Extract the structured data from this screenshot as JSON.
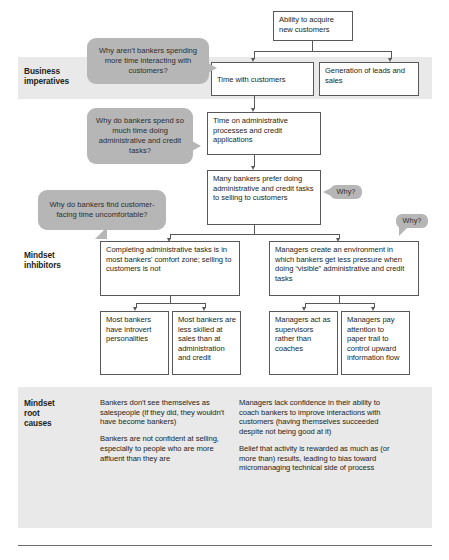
{
  "diagram": {
    "colors": {
      "band": "#e9e9e9",
      "bubble": "#b6b6b6",
      "box_border": "#58585a",
      "text": "#231f20"
    },
    "rows": [
      {
        "id": "business-imperatives",
        "label": "Business\nimperatives"
      },
      {
        "id": "mindset-inhibitors",
        "label": "Mindset\ninhibitors"
      },
      {
        "id": "mindset-root-causes",
        "label": "Mindset\nroot\ncauses"
      }
    ],
    "row_labels": {
      "business_imperatives": "Business imperatives",
      "business_imperatives_l1": "Business",
      "business_imperatives_l2": "imperatives",
      "mindset_inhibitors_l1": "Mindset",
      "mindset_inhibitors_l2": "inhibitors",
      "mindset_root_causes_l1": "Mindset",
      "mindset_root_causes_l2": "root",
      "mindset_root_causes_l3": "causes"
    },
    "boxes": {
      "top": "Ability to acquire new customers",
      "time_with_customers": "Time with customers",
      "generation_of_leads": "Generation of leads and sales",
      "time_on_admin": "Time on administrative processes and credit applications",
      "many_bankers_prefer": "Many bankers prefer doing administrative and credit tasks to selling to customers",
      "completing_admin": "Completing administrative tasks is in most bankers' comfort zone; selling to customers is not",
      "managers_create_env": "Managers create an environment in which bankers get less pressure when doing “visible” administrative and credit tasks",
      "most_bankers_introvert": "Most bankers have introvert personalities",
      "most_bankers_less_skilled": "Most bankers are less skilled at sales than at administration and credit",
      "managers_act_supervisors": "Managers act as supervisors rather than coaches",
      "managers_pay_attention": "Managers pay attention to paper trail to control upward information flow"
    },
    "callouts": {
      "why_arent_bankers": "Why aren't bankers spending more time interacting with customers?",
      "why_do_bankers_spend": "Why do bankers spend so much time doing administrative and credit tasks?",
      "why_do_bankers_find": "Why do bankers find customer-facing time uncomfortable?",
      "why_1": "Why?",
      "why_2": "Why?"
    },
    "root_causes": {
      "left": [
        "Bankers don't see themselves as salespeople (if they did, they wouldn't have become bankers)",
        "Bankers are not confident at selling, especially to people who are more affluent than they are"
      ],
      "right": [
        "Managers lack confidence in their ability to coach bankers to improve interactions with customers (having themselves succeeded despite not being good at it)",
        "Belief that activity is rewarded as much as (or more than) results, leading to bias toward micromanaging technical side of process"
      ]
    }
  }
}
